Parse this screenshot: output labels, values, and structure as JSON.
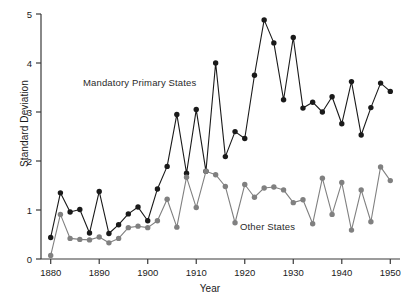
{
  "chart_data": {
    "type": "line",
    "title": "",
    "xlabel": "Year",
    "ylabel": "Standard Deviation",
    "xlim": [
      1878,
      1952
    ],
    "ylim": [
      0,
      5
    ],
    "xticks": [
      1880,
      1890,
      1900,
      1910,
      1920,
      1930,
      1940,
      1950
    ],
    "yticks": [
      0,
      1,
      2,
      3,
      4,
      5
    ],
    "grid": false,
    "legend": "inline-annotations",
    "x": [
      1880,
      1882,
      1884,
      1886,
      1888,
      1890,
      1892,
      1894,
      1896,
      1898,
      1900,
      1902,
      1904,
      1906,
      1908,
      1910,
      1912,
      1914,
      1916,
      1918,
      1920,
      1922,
      1924,
      1926,
      1928,
      1930,
      1932,
      1934,
      1936,
      1938,
      1940,
      1942,
      1944,
      1946,
      1948,
      1950
    ],
    "series": [
      {
        "name": "Mandatory Primary States",
        "color": "#1a1a1a",
        "values": [
          0.44,
          1.35,
          0.96,
          1.01,
          0.53,
          1.38,
          0.52,
          0.7,
          0.92,
          1.06,
          0.78,
          1.43,
          1.89,
          2.95,
          1.75,
          3.05,
          1.79,
          4.0,
          2.09,
          2.6,
          2.46,
          3.75,
          4.88,
          4.41,
          3.25,
          4.52,
          3.08,
          3.2,
          3.0,
          3.31,
          2.76,
          3.62,
          2.53,
          3.09,
          3.59,
          3.42
        ]
      },
      {
        "name": "Other States",
        "color": "#808080",
        "values": [
          0.07,
          0.91,
          0.42,
          0.4,
          0.39,
          0.45,
          0.33,
          0.42,
          0.64,
          0.67,
          0.64,
          0.78,
          1.22,
          0.65,
          1.67,
          1.05,
          1.79,
          1.72,
          1.48,
          0.74,
          1.52,
          1.26,
          1.45,
          1.47,
          1.41,
          1.15,
          1.21,
          0.72,
          1.65,
          0.91,
          1.56,
          0.59,
          1.41,
          0.76,
          1.88,
          1.6
        ]
      }
    ],
    "annotations": [
      {
        "text": "Mandatory Primary States",
        "x": 1895,
        "y": 3.6
      },
      {
        "text": "Other States",
        "x": 1928,
        "y": 0.67
      }
    ]
  }
}
